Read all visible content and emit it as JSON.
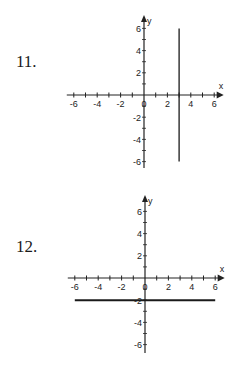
{
  "problems": [
    {
      "number": "11.",
      "description": "Graph of vertical line x = 3"
    },
    {
      "number": "12.",
      "description": "Graph of horizontal line y = -2"
    }
  ],
  "axis": {
    "x_label": "x",
    "y_label": "y",
    "x_ticks": [
      "-6",
      "-4",
      "-2",
      "0",
      "2",
      "4",
      "6"
    ],
    "y_ticks": [
      "6",
      "4",
      "2",
      "-2",
      "-4",
      "-6"
    ]
  },
  "colors": {
    "axis": "#222222",
    "line": "#1a1a1a",
    "background": "#ffffff"
  },
  "chart_data": [
    {
      "type": "line",
      "title": "11.",
      "xlabel": "x",
      "ylabel": "y",
      "xlim": [
        -6,
        6
      ],
      "ylim": [
        -6,
        6
      ],
      "x_tick_labels": [
        "-6",
        "-4",
        "-2",
        "0",
        "2",
        "4",
        "6"
      ],
      "y_tick_labels": [
        "-6",
        "-4",
        "-2",
        "2",
        "4",
        "6"
      ],
      "grid": false,
      "series": [
        {
          "name": "x = 3",
          "x": [
            3,
            3
          ],
          "y": [
            6,
            -6
          ]
        }
      ]
    },
    {
      "type": "line",
      "title": "12.",
      "xlabel": "x",
      "ylabel": "y",
      "xlim": [
        -6,
        6
      ],
      "ylim": [
        -6,
        6
      ],
      "x_tick_labels": [
        "-6",
        "-4",
        "-2",
        "0",
        "2",
        "4",
        "6"
      ],
      "y_tick_labels": [
        "-6",
        "-4",
        "-2",
        "2",
        "4",
        "6"
      ],
      "grid": false,
      "series": [
        {
          "name": "y = -2",
          "x": [
            -6,
            6
          ],
          "y": [
            -2,
            -2
          ]
        }
      ]
    }
  ]
}
